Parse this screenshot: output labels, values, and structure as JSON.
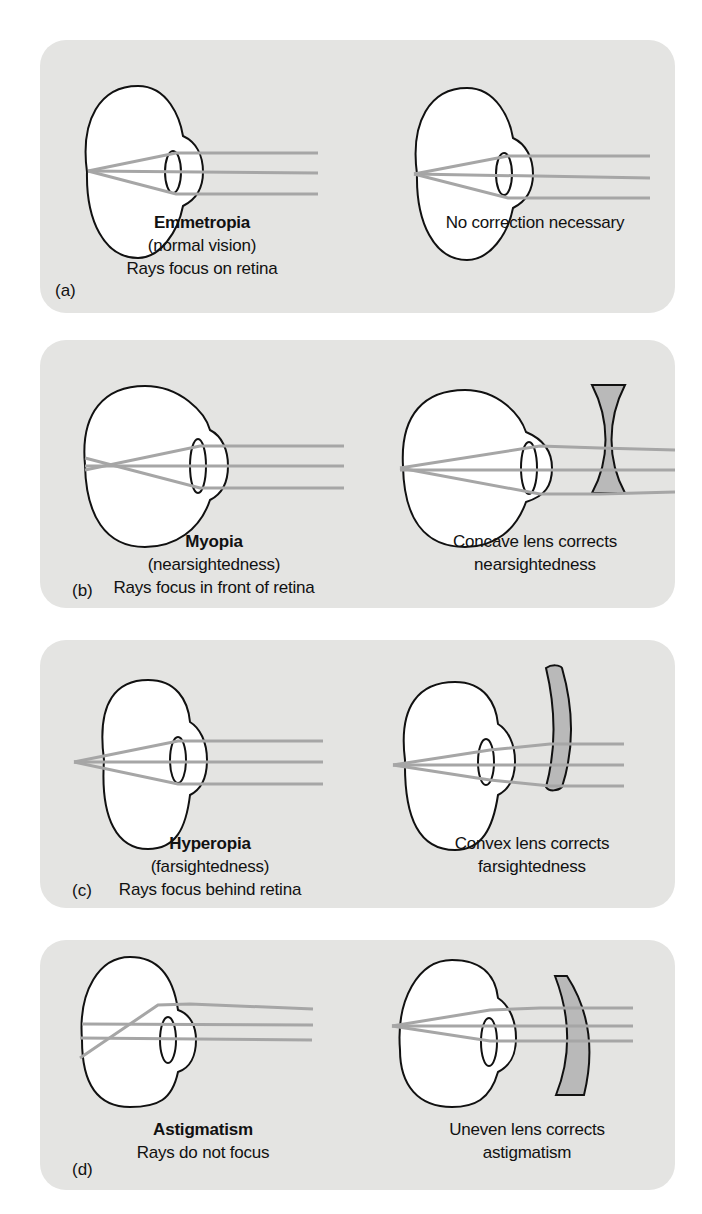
{
  "panels": [
    {
      "id": "a",
      "tag": "(a)",
      "condition": {
        "title": "Emmetropia",
        "lines": [
          "(normal vision)",
          "Rays focus on retina"
        ]
      },
      "correction": {
        "lines": [
          "No correction necessary"
        ]
      }
    },
    {
      "id": "b",
      "tag": "(b)",
      "condition": {
        "title": "Myopia",
        "lines": [
          "(nearsightedness)",
          "Rays focus in front of retina"
        ]
      },
      "correction": {
        "lines": [
          "Concave lens corrects",
          "nearsightedness"
        ]
      }
    },
    {
      "id": "c",
      "tag": "(c)",
      "condition": {
        "title": "Hyperopia",
        "lines": [
          "(farsightedness)",
          "Rays focus behind retina"
        ]
      },
      "correction": {
        "lines": [
          "Convex lens corrects",
          "farsightedness"
        ]
      }
    },
    {
      "id": "d",
      "tag": "(d)",
      "condition": {
        "title": "Astigmatism",
        "lines": [
          "Rays do not focus"
        ]
      },
      "correction": {
        "lines": [
          "Uneven lens corrects",
          "astigmatism"
        ]
      }
    }
  ],
  "colors": {
    "panel_bg": "#e4e4e2",
    "ray": "#a6a6a6",
    "lens_fill": "#b9b9b9",
    "outline": "#111111"
  }
}
